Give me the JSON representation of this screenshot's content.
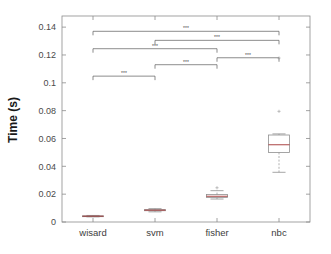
{
  "chart_data": {
    "type": "box",
    "title": "",
    "xlabel": "",
    "ylabel": "Time (s)",
    "categories": [
      "wisard",
      "svm",
      "fisher",
      "nbc"
    ],
    "ylim": [
      0,
      0.148
    ],
    "yticks": [
      0,
      0.02,
      0.04,
      0.06,
      0.08,
      0.1,
      0.12,
      0.14
    ],
    "ytick_labels": [
      "0",
      "0.02",
      "0.04",
      "0.06",
      "0.08",
      "0.1",
      "0.12",
      "0.14"
    ],
    "grid": false,
    "legend": "none",
    "boxes": [
      {
        "category": "wisard",
        "whisker_low": 0.0037,
        "q1": 0.004,
        "median": 0.0042,
        "q3": 0.0044,
        "whisker_high": 0.0047,
        "outliers": []
      },
      {
        "category": "svm",
        "whisker_low": 0.0073,
        "q1": 0.0081,
        "median": 0.0085,
        "q3": 0.0089,
        "whisker_high": 0.0096,
        "outliers": []
      },
      {
        "category": "fisher",
        "whisker_low": 0.0165,
        "q1": 0.0176,
        "median": 0.0185,
        "q3": 0.0197,
        "whisker_high": 0.0225,
        "outliers": [
          0.0246
        ]
      },
      {
        "category": "nbc",
        "whisker_low": 0.0357,
        "q1": 0.05,
        "median": 0.0555,
        "q3": 0.0625,
        "whisker_high": 0.0633,
        "outliers": [
          0.0795,
          0.1178
        ]
      }
    ],
    "significance_bars": [
      {
        "from": "wisard",
        "to": "nbc",
        "y": 0.137,
        "label": "***"
      },
      {
        "from": "svm",
        "to": "nbc",
        "y": 0.1305,
        "label": "***"
      },
      {
        "from": "wisard",
        "to": "fisher",
        "y": 0.1245,
        "label": "***"
      },
      {
        "from": "fisher",
        "to": "nbc",
        "y": 0.118,
        "label": "***"
      },
      {
        "from": "svm",
        "to": "fisher",
        "y": 0.113,
        "label": "***"
      },
      {
        "from": "wisard",
        "to": "svm",
        "y": 0.1048,
        "label": "***"
      }
    ]
  },
  "colors": {
    "axis": "#8c8c8c",
    "box": "#8f8f8f",
    "median": "#a03030",
    "sig_bar": "#5a5a5a",
    "background": "#ffffff",
    "text": "#3d3d3d"
  }
}
